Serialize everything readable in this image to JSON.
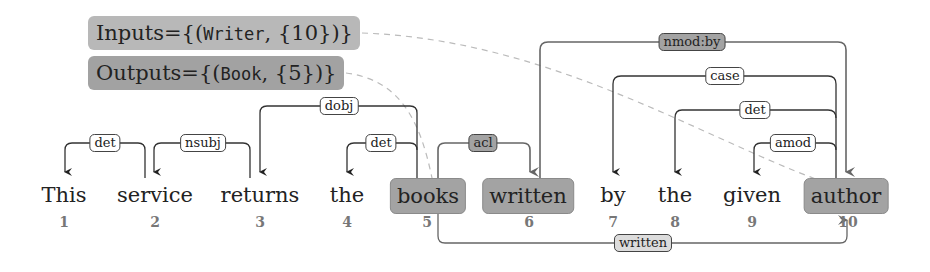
{
  "io": {
    "inputs": {
      "prefix": "Inputs={(",
      "type": "Writer",
      "mid": ", {",
      "indices": "10",
      "suffix": "})}"
    },
    "outputs": {
      "prefix": "Outputs={(",
      "type": "Book",
      "mid": ", {",
      "indices": "5",
      "suffix": "})}"
    }
  },
  "tokens": [
    {
      "word": "This",
      "index": "1",
      "highlighted": false
    },
    {
      "word": "service",
      "index": "2",
      "highlighted": false
    },
    {
      "word": "returns",
      "index": "3",
      "highlighted": false
    },
    {
      "word": "the",
      "index": "4",
      "highlighted": false
    },
    {
      "word": "books",
      "index": "5",
      "highlighted": true
    },
    {
      "word": "written",
      "index": "6",
      "highlighted": true
    },
    {
      "word": "by",
      "index": "7",
      "highlighted": false
    },
    {
      "word": "the",
      "index": "8",
      "highlighted": false
    },
    {
      "word": "given",
      "index": "9",
      "highlighted": false
    },
    {
      "word": "author",
      "index": "10",
      "highlighted": true
    }
  ],
  "arcs": [
    {
      "label": "det",
      "from": 2,
      "to": 1,
      "highlighted": false
    },
    {
      "label": "nsubj",
      "from": 3,
      "to": 2,
      "highlighted": false
    },
    {
      "label": "dobj",
      "from": 3,
      "to": 5,
      "highlighted": false
    },
    {
      "label": "det",
      "from": 5,
      "to": 4,
      "highlighted": false
    },
    {
      "label": "acl",
      "from": 5,
      "to": 6,
      "highlighted": true
    },
    {
      "label": "nmod:by",
      "from": 6,
      "to": 10,
      "highlighted": true
    },
    {
      "label": "case",
      "from": 10,
      "to": 7,
      "highlighted": false
    },
    {
      "label": "det",
      "from": 10,
      "to": 8,
      "highlighted": false
    },
    {
      "label": "amod",
      "from": 10,
      "to": 9,
      "highlighted": false
    }
  ],
  "path_edge": {
    "label": "written",
    "from": 5,
    "to": 10
  }
}
